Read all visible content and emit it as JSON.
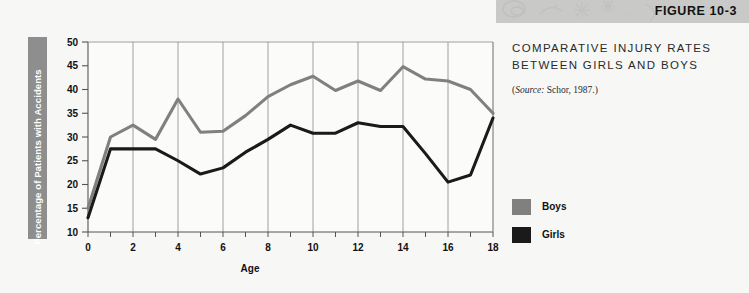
{
  "header": {
    "figure_label": "FIGURE 10-3",
    "band_color": "#c9c9c7"
  },
  "panel": {
    "title_line1": "COMPARATIVE INJURY RATES",
    "title_line2": "BETWEEN GIRLS AND BOYS",
    "source_prefix": "(",
    "source_italic": "Source:",
    "source_rest": " Schor, 1987.)"
  },
  "legend": {
    "items": [
      {
        "label": "Boys",
        "color": "#808080",
        "swatch_name": "legend-swatch-boys"
      },
      {
        "label": "Girls",
        "color": "#1a1a1a",
        "swatch_name": "legend-swatch-girls"
      }
    ]
  },
  "colors": {
    "boys": "#808080",
    "girls": "#1a1a1a",
    "gridline": "#8a8a8a",
    "axis": "#555555",
    "ylabel_box": "#8e8e8e",
    "background": "#f7f7f5",
    "plot_background": "#fbfbfa"
  },
  "chart_data": {
    "type": "line",
    "title": "COMPARATIVE INJURY RATES BETWEEN GIRLS AND BOYS",
    "xlabel": "Age",
    "ylabel": "Percentage of Patients with Accidents",
    "xlim": [
      0,
      18
    ],
    "ylim": [
      10,
      50
    ],
    "ytick_step": 5,
    "yticks": [
      10,
      15,
      20,
      25,
      30,
      35,
      40,
      45,
      50
    ],
    "xticks": [
      0,
      1,
      2,
      3,
      4,
      5,
      6,
      7,
      8,
      9,
      10,
      11,
      12,
      13,
      14,
      15,
      16,
      17,
      18
    ],
    "xtick_labels": [
      0,
      2,
      4,
      6,
      8,
      10,
      12,
      14,
      16,
      18
    ],
    "grid": "vertical-only",
    "gridline_x": [
      0,
      2,
      4,
      6,
      8,
      10,
      12,
      14,
      16,
      18
    ],
    "legend_position": "right",
    "x": [
      0,
      1,
      2,
      3,
      4,
      5,
      6,
      7,
      8,
      9,
      10,
      11,
      12,
      13,
      14,
      15,
      16,
      17,
      18
    ],
    "series": [
      {
        "name": "Boys",
        "color": "#808080",
        "values": [
          15.0,
          30.0,
          32.5,
          29.5,
          38.0,
          31.0,
          31.2,
          34.5,
          38.5,
          41.0,
          42.8,
          39.8,
          41.8,
          39.8,
          44.8,
          42.2,
          41.8,
          40.0,
          35.0
        ]
      },
      {
        "name": "Girls",
        "color": "#1a1a1a",
        "values": [
          13.0,
          27.5,
          27.5,
          27.5,
          25.0,
          22.2,
          23.5,
          26.8,
          29.5,
          32.5,
          30.8,
          30.8,
          33.0,
          32.2,
          32.2,
          26.5,
          20.5,
          22.0,
          34.0
        ]
      }
    ]
  }
}
